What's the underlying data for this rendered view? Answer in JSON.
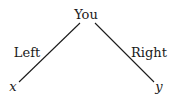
{
  "diagram": {
    "type": "tree",
    "root": {
      "label": "You"
    },
    "edges": [
      {
        "label": "Left",
        "to": "x"
      },
      {
        "label": "Right",
        "to": "y"
      }
    ],
    "leaves": [
      {
        "label": "x"
      },
      {
        "label": "y"
      }
    ]
  }
}
